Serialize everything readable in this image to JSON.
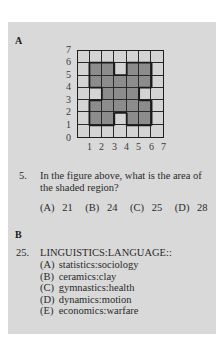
{
  "section_a": {
    "label": "A",
    "figure": {
      "grid_size": 7,
      "x_axis_labels": [
        "1",
        "2",
        "3",
        "4",
        "5",
        "6",
        "7"
      ],
      "y_axis_labels": [
        "7",
        "6",
        "5",
        "4",
        "3",
        "2",
        "1",
        "0"
      ],
      "shaded_cells_top_to_bottom": [
        [
          0,
          0,
          0,
          0,
          0,
          0,
          0
        ],
        [
          0,
          1,
          1,
          0,
          1,
          1,
          0
        ],
        [
          0,
          1,
          1,
          1,
          1,
          1,
          0
        ],
        [
          0,
          0,
          1,
          1,
          1,
          0,
          0
        ],
        [
          0,
          1,
          1,
          1,
          1,
          1,
          0
        ],
        [
          0,
          1,
          1,
          0,
          1,
          1,
          0
        ],
        [
          0,
          0,
          0,
          0,
          0,
          0,
          0
        ]
      ],
      "colors": {
        "shaded": "#8c8c8c",
        "unshaded": "#d4d4d4",
        "grid_line": "#2a2a2a"
      }
    },
    "question": {
      "number": "5.",
      "text": "In the figure above, what is the area of the shaded region?",
      "choices": [
        {
          "letter": "(A)",
          "value": "21"
        },
        {
          "letter": "(B)",
          "value": "24"
        },
        {
          "letter": "(C)",
          "value": "25"
        },
        {
          "letter": "(D)",
          "value": "28"
        },
        {
          "letter": "(E)",
          "value": "32"
        }
      ]
    }
  },
  "section_b": {
    "label": "B",
    "question": {
      "number": "25.",
      "stem": "LINGUISTICS:LANGUAGE::",
      "choices": [
        {
          "letter": "(A)",
          "text": "statistics:sociology"
        },
        {
          "letter": "(B)",
          "text": "ceramics:clay"
        },
        {
          "letter": "(C)",
          "text": "gymnastics:health"
        },
        {
          "letter": "(D)",
          "text": "dynamics:motion"
        },
        {
          "letter": "(E)",
          "text": "economics:warfare"
        }
      ]
    }
  },
  "colors": {
    "panel_background": "#d9d9d9",
    "page_background": "#ffffff",
    "text": "#2a2a2a"
  }
}
